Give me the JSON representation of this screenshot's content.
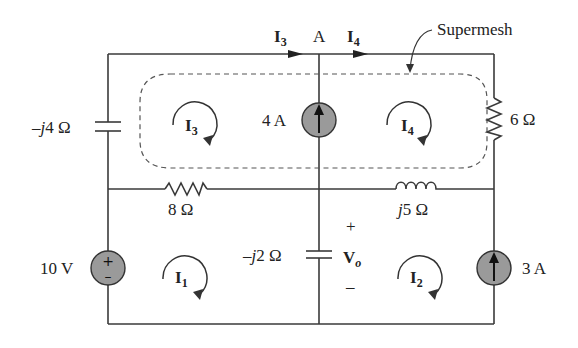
{
  "diagram": {
    "type": "circuit-schematic",
    "annotation": "Supermesh",
    "node_label": "A",
    "branch_currents": [
      {
        "name": "I",
        "sub": "3",
        "id": "I3"
      },
      {
        "name": "I",
        "sub": "4",
        "id": "I4"
      }
    ],
    "mesh_currents": [
      {
        "name": "I",
        "sub": "1"
      },
      {
        "name": "I",
        "sub": "2"
      },
      {
        "name": "I",
        "sub": "3"
      },
      {
        "name": "I",
        "sub": "4"
      }
    ],
    "components": {
      "cap_left": {
        "label_prefix": "–",
        "label_j": "j",
        "label_rest": "4 Ω"
      },
      "res_6": {
        "label": "6 Ω"
      },
      "cur_src_4": {
        "label": "4 A"
      },
      "res_8": {
        "label": "8 Ω"
      },
      "ind_j5": {
        "label_j": "j",
        "label_rest": "5 Ω"
      },
      "vsrc_10": {
        "label": "10 V",
        "plus": "+",
        "minus": "–"
      },
      "cap_mid": {
        "label_prefix": "–",
        "label_j": "j",
        "label_rest": "2 Ω"
      },
      "vo": {
        "name": "V",
        "sub": "o",
        "plus": "+",
        "minus": "–"
      },
      "cur_src_3": {
        "label": "3 A"
      }
    },
    "colors": {
      "wire": "#3a3a3a",
      "source_fill": "#9a9a9a",
      "dashed": "#555555"
    }
  }
}
